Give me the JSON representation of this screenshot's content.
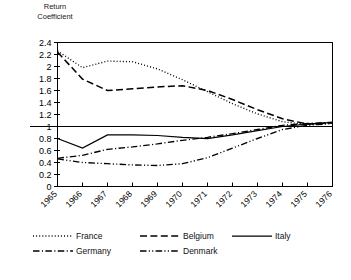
{
  "chart_data": {
    "type": "line",
    "title": "",
    "ylabel": "Return\nCoefficient",
    "xlabel": "",
    "categories": [
      "1965",
      "1966",
      "1967",
      "1968",
      "1969",
      "1970",
      "1971",
      "1972",
      "1973",
      "1974",
      "1975",
      "1976"
    ],
    "x": [
      1965,
      1966,
      1967,
      1968,
      1969,
      1970,
      1971,
      1972,
      1973,
      1974,
      1975,
      1976
    ],
    "ylim": [
      0,
      2.4
    ],
    "yticks": [
      0,
      0.2,
      0.4,
      0.6,
      0.8,
      1,
      1.2,
      1.4,
      1.6,
      1.8,
      2,
      2.2,
      2.4
    ],
    "ytick_labels": [
      "0",
      "0.2",
      "0.4",
      "0.6",
      "0.8",
      "1",
      "1.2",
      "1.4",
      "1.6",
      "1.8",
      "2",
      "2.2",
      "2.4"
    ],
    "grid": false,
    "reference_line": 1,
    "legend_position": "bottom",
    "xtick_rotation": -45,
    "series": [
      {
        "name": "France",
        "style": "dotted",
        "color": "#000000",
        "values": [
          2.26,
          1.98,
          2.09,
          2.08,
          1.96,
          1.78,
          1.58,
          1.38,
          1.21,
          1.08,
          1.03,
          1.06
        ]
      },
      {
        "name": "Belgium",
        "style": "dashed",
        "color": "#000000",
        "values": [
          2.24,
          1.79,
          1.6,
          1.63,
          1.66,
          1.68,
          1.6,
          1.45,
          1.28,
          1.13,
          1.04,
          1.06
        ]
      },
      {
        "name": "Italy",
        "style": "solid",
        "color": "#000000",
        "values": [
          0.8,
          0.64,
          0.86,
          0.86,
          0.85,
          0.82,
          0.8,
          0.86,
          0.93,
          1.0,
          1.04,
          1.07
        ]
      },
      {
        "name": "Germany",
        "style": "dash-dot",
        "color": "#000000",
        "values": [
          0.47,
          0.52,
          0.62,
          0.66,
          0.71,
          0.77,
          0.82,
          0.88,
          0.95,
          1.02,
          1.05,
          1.07
        ]
      },
      {
        "name": "Denmark",
        "style": "dash-dot-dot",
        "color": "#000000",
        "values": [
          0.46,
          0.4,
          0.38,
          0.36,
          0.35,
          0.38,
          0.48,
          0.64,
          0.8,
          0.95,
          1.02,
          1.05
        ]
      }
    ]
  },
  "legend": {
    "items": [
      {
        "label": "France",
        "style": "dotted"
      },
      {
        "label": "Belgium",
        "style": "dashed"
      },
      {
        "label": "Italy",
        "style": "solid"
      },
      {
        "label": "Germany",
        "style": "dash-dot"
      },
      {
        "label": "Denmark",
        "style": "dash-dot-dot"
      }
    ]
  }
}
